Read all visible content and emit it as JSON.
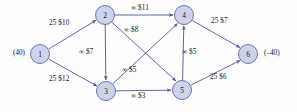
{
  "figure": {
    "type": "directed-network-flow-graph",
    "width": 297,
    "height": 112,
    "colors": {
      "node_fill": "#ccd3ea",
      "node_stroke": "#5a68a8",
      "edge_stroke": "#4a5a9a",
      "text": "#16161d",
      "background": "#fdfdfd"
    }
  },
  "nodes": [
    {
      "id": "1",
      "label": "1",
      "cx": 40,
      "cy": 54,
      "r": 9.5
    },
    {
      "id": "2",
      "label": "2",
      "cx": 105,
      "cy": 15,
      "r": 9.5
    },
    {
      "id": "3",
      "label": "3",
      "cx": 106,
      "cy": 91,
      "r": 9.5
    },
    {
      "id": "4",
      "label": "4",
      "cx": 184,
      "cy": 15,
      "r": 9.5
    },
    {
      "id": "5",
      "label": "5",
      "cx": 182,
      "cy": 90,
      "r": 9.5
    },
    {
      "id": "6",
      "label": "6",
      "cx": 248,
      "cy": 54,
      "r": 9.5
    }
  ],
  "supply_labels": [
    {
      "name": "supply-node-1",
      "text": "(40)",
      "x": 13,
      "y": 50
    },
    {
      "name": "demand-node-6",
      "text": "(–40)",
      "x": 264,
      "y": 50
    }
  ],
  "edges": [
    {
      "id": "e-1-2",
      "from": "1",
      "to": "2",
      "capacity": "25",
      "cost": "$10",
      "label": "25 $10",
      "label_x": 49,
      "label_y": 20
    },
    {
      "id": "e-1-3",
      "from": "1",
      "to": "3",
      "capacity": "25",
      "cost": "$12",
      "label": "25 $12",
      "label_x": 49,
      "label_y": 76
    },
    {
      "id": "e-2-3",
      "from": "2",
      "to": "3",
      "capacity": "∞",
      "cost": "$7",
      "label": "∞ $7",
      "label_x": 79,
      "label_y": 49
    },
    {
      "id": "e-2-4",
      "from": "2",
      "to": "4",
      "capacity": "∞",
      "cost": "$11",
      "label": "∞ $11",
      "label_x": 131,
      "label_y": 5
    },
    {
      "id": "e-2-5",
      "from": "2",
      "to": "5",
      "capacity": "∞",
      "cost": "$8",
      "label": "∞ $8",
      "label_x": 124,
      "label_y": 27
    },
    {
      "id": "e-3-4",
      "from": "3",
      "to": "4",
      "capacity": "∞",
      "cost": "$5",
      "label": "∞ $5",
      "label_x": 122,
      "label_y": 67
    },
    {
      "id": "e-3-5",
      "from": "3",
      "to": "5",
      "capacity": "∞",
      "cost": "$3",
      "label": "∞ $3",
      "label_x": 131,
      "label_y": 93
    },
    {
      "id": "e-5-4",
      "from": "5",
      "to": "4",
      "capacity": "∞",
      "cost": "$5",
      "label": "∞ $5",
      "label_x": 182,
      "label_y": 49
    },
    {
      "id": "e-4-6",
      "from": "4",
      "to": "6",
      "capacity": "25",
      "cost": "$7",
      "label": "25 $7",
      "label_x": 211,
      "label_y": 18
    },
    {
      "id": "e-5-6",
      "from": "5",
      "to": "6",
      "capacity": "25",
      "cost": "$6",
      "label": "25 $6",
      "label_x": 210,
      "label_y": 74
    }
  ]
}
